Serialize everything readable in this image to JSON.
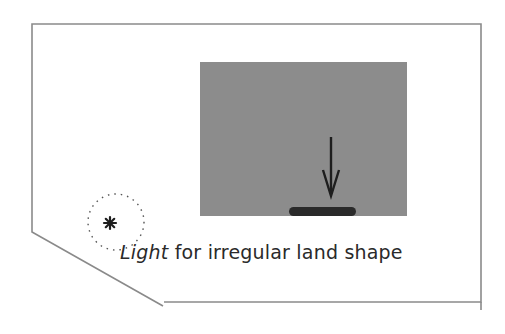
{
  "diagram": {
    "caption": {
      "emphasis": "Light",
      "rest": " for irregular land shape"
    },
    "elements": {
      "land_boundary": "irregular-lot-outline",
      "building": "gray-rectangle",
      "light_source": "star-in-dotted-circle",
      "direction": "down-arrow",
      "wall_opening": "dark-bar"
    },
    "colors": {
      "boundary": "#8a8a8a",
      "building_fill": "#8c8c8c",
      "arrow": "#1e1e1e",
      "bar": "#2a2a2a",
      "text": "#2a2a2a"
    }
  }
}
